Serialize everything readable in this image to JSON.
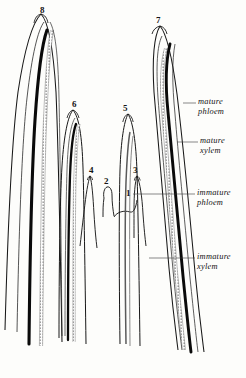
{
  "figure": {
    "background_color": "#fdfdfb",
    "ink_color": "#141414",
    "width": 246,
    "height": 378
  },
  "numbered_primordia": [
    {
      "id": "1",
      "label": "1",
      "x": 126,
      "y": 189,
      "description": "youngest primordium, low flat arch"
    },
    {
      "id": "2",
      "label": "2",
      "x": 104,
      "y": 177,
      "description": "small rounded bump"
    },
    {
      "id": "3",
      "label": "3",
      "x": 133,
      "y": 166,
      "description": "short narrow spike"
    },
    {
      "id": "4",
      "label": "4",
      "x": 89,
      "y": 166,
      "description": "short narrow spike"
    },
    {
      "id": "5",
      "label": "5",
      "x": 123,
      "y": 104,
      "description": "tall spike with first procambium"
    },
    {
      "id": "6",
      "label": "6",
      "x": 72,
      "y": 100,
      "description": "tall primordium with xylem and phloem strands"
    },
    {
      "id": "7",
      "label": "7",
      "x": 156,
      "y": 16,
      "description": "large curved leaf with full vascular tissue"
    },
    {
      "id": "8",
      "label": "8",
      "x": 40,
      "y": 6,
      "description": "oldest, largest leaf with mature vascular tissue"
    }
  ],
  "tissue_labels": [
    {
      "id": "mature-phloem",
      "line1": "mature",
      "line2": "phloem",
      "text_x": 198,
      "text_y": 97,
      "leader": {
        "x1": 183,
        "y1": 103,
        "x2": 196,
        "y2": 103
      }
    },
    {
      "id": "mature-xylem",
      "line1": "mature",
      "line2": "xylem",
      "text_x": 200,
      "text_y": 136,
      "leader": {
        "x1": 177,
        "y1": 142,
        "x2": 198,
        "y2": 142
      }
    },
    {
      "id": "immature-phloem",
      "line1": "immature",
      "line2": "phloem",
      "text_x": 197,
      "text_y": 188,
      "leader": {
        "x1": 133,
        "y1": 194,
        "x2": 195,
        "y2": 194
      }
    },
    {
      "id": "immature-xylem",
      "line1": "immature",
      "line2": "xylem",
      "text_x": 197,
      "text_y": 252,
      "leader": {
        "x1": 149,
        "y1": 258,
        "x2": 195,
        "y2": 258
      }
    }
  ]
}
